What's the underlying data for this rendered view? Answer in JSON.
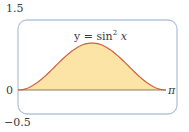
{
  "chart_data": {
    "type": "area",
    "title": "",
    "function_label": "y = sin² x",
    "function_label_parts": {
      "lhs": "y = sin",
      "exponent": "2",
      "var": "x"
    },
    "xlabel": "",
    "ylabel": "",
    "x_ticks": [
      {
        "value": 0,
        "label": "0"
      },
      {
        "value": 3.14159,
        "label": "π"
      }
    ],
    "y_ticks": [
      {
        "value": 1.5,
        "label": "1.5"
      },
      {
        "value": -0.5,
        "label": "−0.5"
      }
    ],
    "xlim": [
      0,
      3.14159
    ],
    "ylim": [
      -0.5,
      1.5
    ],
    "grid": false,
    "legend": null,
    "x": [
      0,
      0.3927,
      0.7854,
      1.1781,
      1.5708,
      1.9635,
      2.3562,
      2.7489,
      3.14159
    ],
    "values": [
      0,
      0.1464,
      0.5,
      0.8536,
      1.0,
      0.8536,
      0.5,
      0.1464,
      0
    ],
    "fill": "area under curve shaded from 0 to π",
    "colors": {
      "curve": "#d0603e",
      "fill": "#fbe4a6",
      "frame": "#a9bfd6",
      "axis": "#8a7a5a"
    }
  },
  "labels": {
    "y_top": "1.5",
    "y_zero": "0",
    "y_bottom": "−0.5",
    "x_end": "π",
    "fn_main": "y = sin",
    "fn_exp": "2",
    "fn_var": " x"
  }
}
